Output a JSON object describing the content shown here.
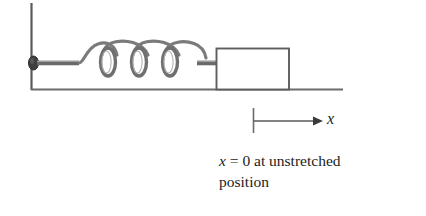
{
  "figure": {
    "caption": {
      "line1_prefix": "x",
      "line1_rest": " = 0 at unstretched",
      "line2": "position",
      "full_text": "x = 0 at unstretched position"
    },
    "axis": {
      "label": "x",
      "origin_label": "x = 0",
      "direction": "right"
    },
    "colors": {
      "ink": "#4a4a4a",
      "ink_dark": "#2b2b2b",
      "text": "#1c1c1c",
      "background": "#ffffff",
      "anchor": "#3a3a3a"
    },
    "elements": {
      "wall_name": "wall",
      "ground_name": "ground-surface",
      "spring_name": "coil-spring",
      "block_name": "block",
      "anchor_name": "spring-wall-anchor",
      "tick_name": "origin-tick",
      "arrow_name": "x-axis-arrow"
    },
    "geometry": {
      "wall_x": 31,
      "wall_top": 3,
      "wall_bottom": 90,
      "ground_y": 89,
      "ground_left": 31,
      "ground_right": 343,
      "spring_axis_y": 63,
      "spring_start_x": 78,
      "spring_end_x": 175,
      "spring_coils": 3,
      "block_left": 216,
      "block_right": 289,
      "block_top": 48,
      "block_bottom": 89,
      "tick_x": 253,
      "tick_top": 108,
      "tick_bottom": 133,
      "arrow_y": 121,
      "arrow_end_x": 322
    }
  }
}
